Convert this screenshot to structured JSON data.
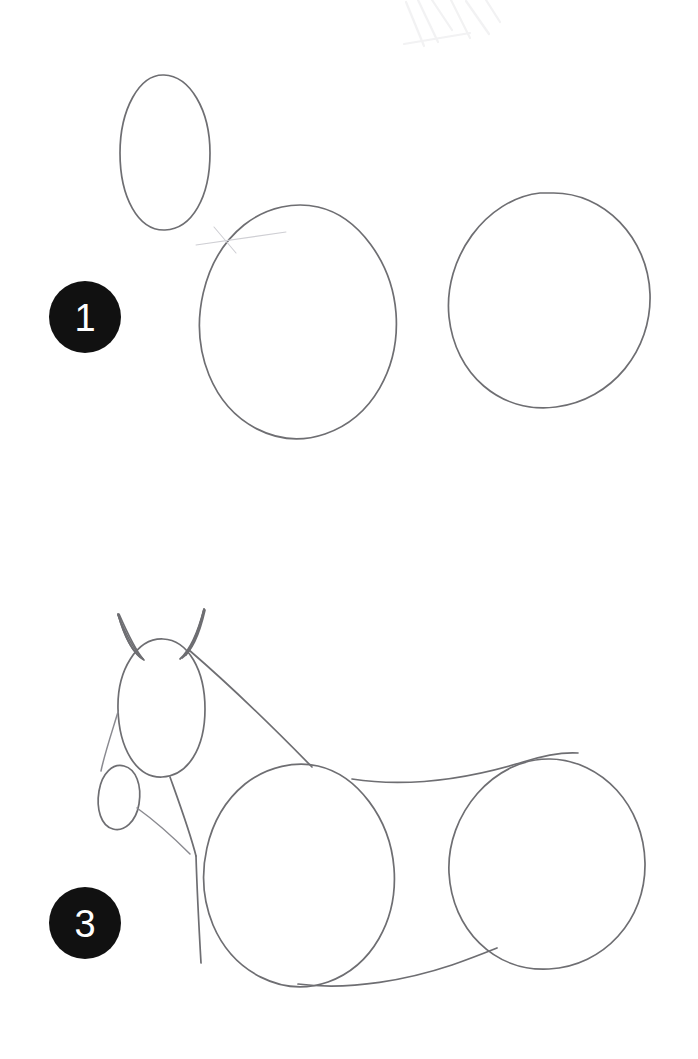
{
  "page": {
    "medium": "pencil-sketch",
    "background_color": "#ffffff",
    "width": 698,
    "height": 1059
  },
  "palette": {
    "paper": "#ffffff",
    "pencil_line": "#6e6e72",
    "pencil_light": "#8a8a90",
    "pencil_ghost": "#cfcfd4",
    "badge_fill": "#111111",
    "badge_text": "#ffffff",
    "smudge": "#f0f0f2"
  },
  "steps": [
    {
      "id": "step-1",
      "number": "1",
      "badge": {
        "label": "1",
        "cx": 85,
        "cy": 317,
        "r": 36,
        "fill": "#111111",
        "text_color": "#ffffff"
      },
      "description": "Three basic construction ovals: head, chest and hindquarters.",
      "shapes": [
        {
          "name": "head-oval",
          "type": "ellipse",
          "cx": 165,
          "cy": 153,
          "rx": 45,
          "ry": 78,
          "rotate": -4
        },
        {
          "name": "chest-oval",
          "type": "ellipse",
          "cx": 298,
          "cy": 322,
          "rx": 100,
          "ry": 117,
          "rotate": -16
        },
        {
          "name": "hindquarter-oval",
          "type": "ellipse",
          "cx": 549,
          "cy": 300,
          "rx": 101,
          "ry": 108,
          "rotate": -8
        }
      ]
    },
    {
      "id": "step-3",
      "number": "3",
      "badge": {
        "label": "3",
        "cx": 85,
        "cy": 923,
        "r": 36,
        "fill": "#111111",
        "text_color": "#ffffff"
      },
      "description": "Construction ovals joined with neck, back, belly and chest lines; ears and muzzle added.",
      "shapes": [
        {
          "name": "head-oval",
          "type": "ellipse",
          "cx": 161,
          "cy": 707,
          "rx": 44,
          "ry": 69,
          "rotate": -3
        },
        {
          "name": "muzzle-oval",
          "type": "ellipse",
          "cx": 120,
          "cy": 798,
          "rx": 21,
          "ry": 33,
          "rotate": 12
        },
        {
          "name": "chest-oval",
          "type": "ellipse",
          "cx": 295,
          "cy": 875,
          "rx": 100,
          "ry": 110,
          "rotate": -15
        },
        {
          "name": "hindquarter-oval",
          "type": "ellipse",
          "cx": 547,
          "cy": 864,
          "rx": 99,
          "ry": 106,
          "rotate": -6
        },
        {
          "name": "left-ear",
          "type": "triangle"
        },
        {
          "name": "right-ear",
          "type": "triangle"
        },
        {
          "name": "neck-top-line",
          "type": "line"
        },
        {
          "name": "neck-front-line",
          "type": "line"
        },
        {
          "name": "jaw-line",
          "type": "line"
        },
        {
          "name": "chest-front-line",
          "type": "line"
        },
        {
          "name": "back-line",
          "type": "line"
        },
        {
          "name": "belly-line",
          "type": "line"
        }
      ]
    }
  ],
  "artifacts": {
    "eraser_smudges": [
      {
        "name": "top-smudge",
        "x": 400,
        "y": 5
      }
    ],
    "ghost_guides": [
      {
        "name": "chest-guide-line",
        "x": 195,
        "y": 238
      }
    ]
  }
}
